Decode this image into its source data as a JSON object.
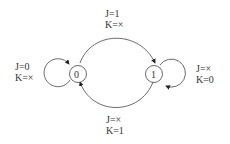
{
  "diagram": {
    "type": "state-diagram",
    "states": [
      {
        "id": "s0",
        "label": "0"
      },
      {
        "id": "s1",
        "label": "1"
      }
    ],
    "transitions": [
      {
        "from": "0",
        "to": "0",
        "line1": "J=0",
        "line2": "K=×"
      },
      {
        "from": "0",
        "to": "1",
        "line1": "J=1",
        "line2": "K=×"
      },
      {
        "from": "1",
        "to": "1",
        "line1": "J=×",
        "line2": "K=0"
      },
      {
        "from": "1",
        "to": "0",
        "line1": "J=×",
        "line2": "K=1"
      }
    ]
  }
}
